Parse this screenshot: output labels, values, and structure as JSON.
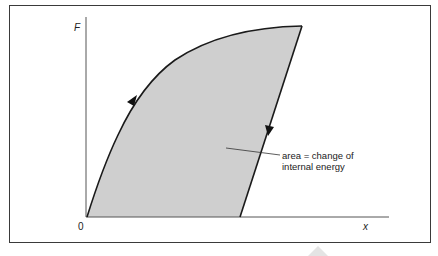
{
  "diagram": {
    "title": "",
    "axes": {
      "y_label": "F",
      "x_label": "x",
      "origin_label": "0"
    },
    "annotation": {
      "line1": "area = change of",
      "line2": "internal energy"
    },
    "colors": {
      "fill": "#cfcfcf",
      "stroke": "#1a1a1a",
      "axis": "#555555",
      "frame": "#3a3a3a"
    },
    "arrows": [
      {
        "name": "loading-arrow",
        "direction": "up"
      },
      {
        "name": "unloading-arrow",
        "direction": "down"
      }
    ]
  }
}
